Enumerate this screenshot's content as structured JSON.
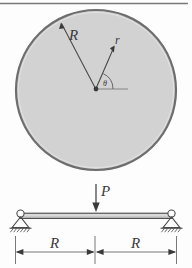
{
  "figure": {
    "background_color": "#fdfdfd",
    "top_rule_color": "#7a7a7a"
  },
  "circle": {
    "name": "circular-cross-section",
    "fill_color": "#d2d2d2",
    "stroke_color": "#6e6e6e",
    "center_dot_color": "#3a3a3a",
    "radius_label": "R",
    "inner_radius_label": "r",
    "angle_label": "θ"
  },
  "beam": {
    "name": "simply-supported-beam",
    "load_label": "P",
    "bar_fill_color": "#c9c9c9",
    "bar_stroke_color": "#4a4a4a",
    "support_stroke_color": "#4a4a4a",
    "left_support_type": "pin-support",
    "right_support_type": "pin-support",
    "dimensions": [
      {
        "label": "R",
        "side": "left"
      },
      {
        "label": "R",
        "side": "right"
      }
    ],
    "dimension_line_color": "#6a6a6a"
  }
}
